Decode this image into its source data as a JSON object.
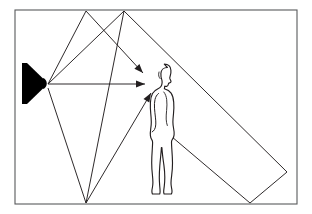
{
  "figure": {
    "type": "acoustics-ray-diagram",
    "background_color": "#ffffff",
    "line_color": "#231f20",
    "frame_color": "#58595b",
    "speaker_color": "#000000",
    "canvas": {
      "width": 312,
      "height": 214
    }
  },
  "room": {
    "name": "room-boundary",
    "x": 15,
    "y": 10,
    "width": 282,
    "height": 194,
    "stroke_width": 1.1
  },
  "speaker": {
    "name": "loudspeaker",
    "label": "loudspeaker",
    "baffle_x": 22,
    "top_y": 63,
    "bottom_y": 104,
    "cone_tip_x": 47,
    "cone_tip_y": 83.5,
    "fill": "#000000"
  },
  "listener": {
    "name": "listener-figure",
    "label": "listener",
    "head_center_x": 163,
    "head_center_y": 76,
    "feet_y": 200,
    "outline_color": "#231f20"
  },
  "rays": [
    {
      "id": "direct",
      "label": "direct sound",
      "reflection_surface": "none",
      "points": [
        [
          48,
          84
        ],
        [
          145,
          84
        ]
      ],
      "arrow_at": [
        145,
        84
      ]
    },
    {
      "id": "ceiling-near",
      "label": "first ceiling reflection",
      "reflection_surface": "ceiling",
      "points": [
        [
          48,
          84
        ],
        [
          86,
          11
        ],
        [
          143,
          73
        ]
      ],
      "arrow_at": [
        143,
        73
      ]
    },
    {
      "id": "ceiling-far",
      "label": "second ceiling reflection",
      "reflection_surface": "ceiling",
      "points": [
        [
          48,
          84
        ],
        [
          124,
          11
        ],
        [
          86,
          203
        ]
      ],
      "arrow_at": null
    },
    {
      "id": "floor",
      "label": "floor reflection",
      "reflection_surface": "floor",
      "points": [
        [
          48,
          88
        ],
        [
          86,
          203
        ],
        [
          151,
          93
        ]
      ],
      "arrow_at": [
        151,
        93
      ]
    },
    {
      "id": "rear-wall",
      "label": "rear wall reflection",
      "reflection_surface": "right wall and floor",
      "points": [
        [
          124,
          11
        ],
        [
          287,
          172
        ],
        [
          250,
          203
        ],
        [
          165,
          131
        ]
      ],
      "arrow_at": [
        165,
        131
      ]
    }
  ],
  "arrowhead": {
    "name": "ray-arrowhead",
    "length": 9,
    "half_width": 3.4,
    "fill": "#231f20"
  }
}
